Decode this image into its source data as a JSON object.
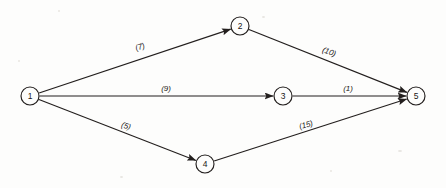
{
  "diagram": {
    "type": "directed-network-graph",
    "background_color": "#fdfdfc",
    "line_color": "#231f1e",
    "node_radius": 9,
    "nodes": [
      {
        "id": "1",
        "label": "1",
        "x": 30,
        "y": 96
      },
      {
        "id": "2",
        "label": "2",
        "x": 240,
        "y": 26
      },
      {
        "id": "3",
        "label": "3",
        "x": 283,
        "y": 96
      },
      {
        "id": "4",
        "label": "4",
        "x": 205,
        "y": 164
      },
      {
        "id": "5",
        "label": "5",
        "x": 416,
        "y": 96
      }
    ],
    "edges": [
      {
        "from": "1",
        "to": "2",
        "weight": 7,
        "label": "(7)",
        "label_x": 140,
        "label_y": 47,
        "label_rotate": -18
      },
      {
        "from": "2",
        "to": "5",
        "weight": 10,
        "label": "(10)",
        "label_x": 329,
        "label_y": 52,
        "label_rotate": 20
      },
      {
        "from": "1",
        "to": "3",
        "weight": 9,
        "label": "(9)",
        "label_x": 166,
        "label_y": 88,
        "label_rotate": 0
      },
      {
        "from": "3",
        "to": "5",
        "weight": 1,
        "label": "(1)",
        "label_x": 348,
        "label_y": 88,
        "label_rotate": 0
      },
      {
        "from": "1",
        "to": "4",
        "weight": 5,
        "label": "(5)",
        "label_x": 126,
        "label_y": 126,
        "label_rotate": 18
      },
      {
        "from": "4",
        "to": "5",
        "weight": 15,
        "label": "(15)",
        "label_x": 306,
        "label_y": 125,
        "label_rotate": -16
      }
    ]
  }
}
